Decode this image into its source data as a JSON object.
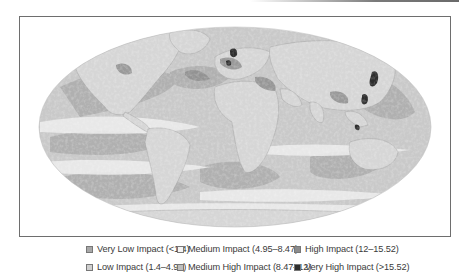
{
  "map": {
    "projection": "mollweide-world",
    "subject": "Cumulative human impact on marine ecosystems",
    "colors": {
      "land": "#d3d3d3",
      "very_low": "#a8a8a8",
      "low": "#cfcfcf",
      "medium": "#eeeeee",
      "medium_high": "#bdbdbd",
      "high": "#8c8c8c",
      "very_high": "#2e2e2e",
      "frame": "#6e6e6e"
    }
  },
  "legend": {
    "items": [
      {
        "label": "Very Low Impact (<1.4)",
        "color": "#a8a8a8"
      },
      {
        "label": "Low Impact (1.4–4.95)",
        "color": "#cfcfcf"
      },
      {
        "label": "Medium Impact (4.95–8.47)",
        "color": "#f4f4f4"
      },
      {
        "label": "Medium High Impact (8.47–12)",
        "color": "#bdbdbd"
      },
      {
        "label": "High Impact (12–15.52)",
        "color": "#8c8c8c"
      },
      {
        "label": "Very High Impact (>15.52)",
        "color": "#2e2e2e"
      }
    ]
  }
}
